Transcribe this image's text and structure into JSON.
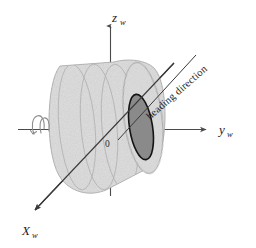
{
  "figure": {
    "background_color": "#ffffff",
    "width": 256,
    "height": 248
  },
  "axes": {
    "z": {
      "label": "z",
      "subscript": "w",
      "icon": "axis-arrow-up-icon",
      "color": "#4a4a4a"
    },
    "y": {
      "label": "y",
      "subscript": "w",
      "icon": "axis-arrow-right-icon",
      "color": "#4a4a4a"
    },
    "x": {
      "label": "X",
      "subscript": "w",
      "icon": "axis-arrow-down-left-icon",
      "color": "#3a3a3a"
    },
    "origin": {
      "label": "0"
    }
  },
  "annotations": {
    "heading": {
      "label": "heading direction",
      "icon": "heading-direction-line-icon",
      "rotation_deg": -37,
      "color": "#3a3a3a"
    },
    "spin": {
      "icon": "rotation-curl-icon",
      "color": "#8d8d8d"
    }
  },
  "wheel": {
    "name": "wheel-body",
    "body_color": "#dcdcdc",
    "body_stroke": "#a6a6a6",
    "tread_line_color": "#b0b0b0",
    "hub_color": "#8a8a8a",
    "hub_stroke": "#1a1a1a",
    "tread_rings": 4
  }
}
